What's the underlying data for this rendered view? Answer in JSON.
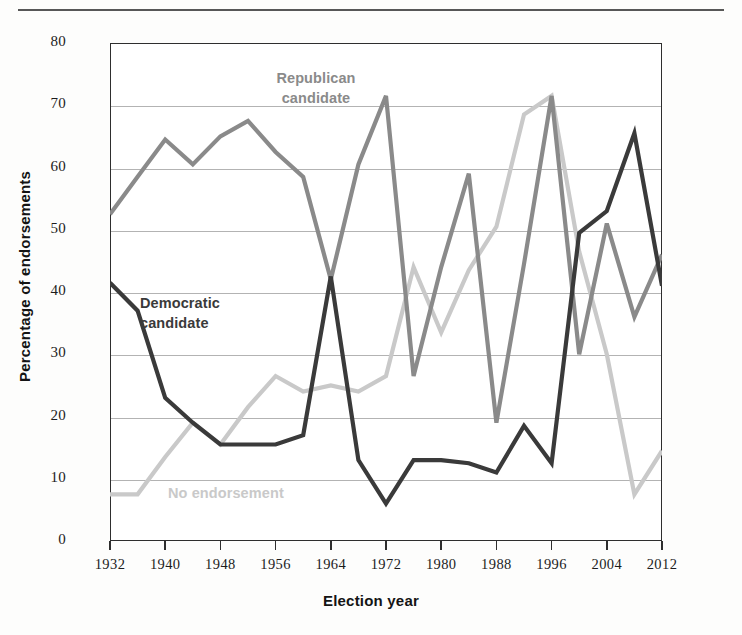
{
  "chart_data": {
    "type": "line",
    "title": "",
    "xlabel": "Election year",
    "ylabel": "Percentage of endorsements",
    "xlim": [
      1932,
      2012
    ],
    "ylim": [
      0,
      80
    ],
    "grid": "horizontal",
    "legend_position": "inline-annotations",
    "x": [
      1932,
      1936,
      1940,
      1944,
      1948,
      1952,
      1956,
      1960,
      1964,
      1968,
      1972,
      1976,
      1980,
      1984,
      1988,
      1992,
      1996,
      2000,
      2004,
      2008,
      2012
    ],
    "xtick_labels": [
      "1932",
      "1940",
      "1948",
      "1956",
      "1964",
      "1972",
      "1980",
      "1988",
      "1996",
      "2004",
      "2012"
    ],
    "ytick_labels": [
      "0",
      "10",
      "20",
      "30",
      "40",
      "50",
      "60",
      "70",
      "80"
    ],
    "ytick_values": [
      0,
      10,
      20,
      30,
      40,
      50,
      60,
      70,
      80
    ],
    "series": [
      {
        "name": "Republican candidate",
        "color": "#8a8a8a",
        "values": [
          52.5,
          58.5,
          64.5,
          60.5,
          65.0,
          67.5,
          62.5,
          58.5,
          42.0,
          60.5,
          71.5,
          26.5,
          44.0,
          59.0,
          19.0,
          44.5,
          71.5,
          30.0,
          51.0,
          36.0,
          46.0
        ]
      },
      {
        "name": "Democratic candidate",
        "color": "#3a3a3a",
        "values": [
          41.5,
          37.0,
          23.0,
          19.0,
          15.5,
          15.5,
          15.5,
          17.0,
          42.5,
          13.0,
          6.0,
          13.0,
          13.0,
          12.5,
          11.0,
          18.5,
          12.5,
          49.5,
          53.0,
          65.5,
          41.0
        ]
      },
      {
        "name": "No endorsement",
        "color": "#c9c9c9",
        "values": [
          7.5,
          7.5,
          13.5,
          19.0,
          15.5,
          21.5,
          26.5,
          24.0,
          25.0,
          24.0,
          26.5,
          44.0,
          33.5,
          43.5,
          50.5,
          68.5,
          71.5,
          46.5,
          30.0,
          7.5,
          14.5
        ]
      }
    ],
    "annotations": [
      {
        "id": "republican",
        "text": "Republican\ncandidate",
        "color": "#8a8a8a"
      },
      {
        "id": "democratic",
        "text": "Democratic\ncandidate",
        "color": "#3a3a3a"
      },
      {
        "id": "no-endorsement",
        "text": "No endorsement",
        "color": "#c9c9c9"
      }
    ]
  }
}
